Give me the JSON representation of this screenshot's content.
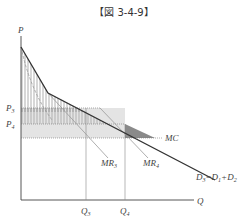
{
  "title": "【図 3-4-9】",
  "axes": {
    "y_label": "P",
    "x_label": "Q"
  },
  "price_labels": {
    "p3": "P",
    "p3_sub": "3",
    "p4": "P",
    "p4_sub": "4"
  },
  "quantity_labels": {
    "q3": "Q",
    "q3_sub": "3",
    "q4": "Q",
    "q4_sub": "4"
  },
  "curve_labels": {
    "mc": "MC",
    "mr3": "MR",
    "mr3_sub": "3",
    "mr4": "MR",
    "mr4_sub": "4",
    "demand": "D",
    "demand_sub": "3",
    "demand_eq": "=D",
    "demand_sub1": "1",
    "demand_plus": "+D",
    "demand_sub2": "2"
  },
  "colors": {
    "line": "#333333",
    "hatch": "#888888",
    "light_fill": "#e6e6e6",
    "dark_fill": "#8a8a8a"
  }
}
